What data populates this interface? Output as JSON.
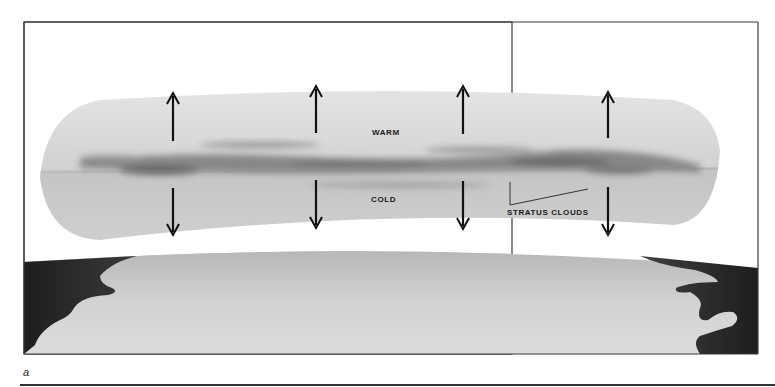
{
  "figure": {
    "panel_label": "a",
    "frame": {
      "x": 24,
      "y": 22,
      "width": 488,
      "height": 332,
      "stroke": "#3a3a3a"
    },
    "labels": {
      "warm": "WARM",
      "cold": "COLD",
      "stratus_clouds": "STRATUS CLOUDS"
    },
    "arrows": {
      "up_x": [
        173,
        316,
        463,
        608
      ],
      "down_x": [
        173,
        316,
        463,
        608
      ]
    },
    "colors": {
      "band_upper": "#d9d9d9",
      "band_lower": "#c9c9c9",
      "cloud_dark": "#5e5e5e",
      "ground_light": "#d8d8d8",
      "ground_dark": "#2c2c2c",
      "ink": "#111111"
    }
  }
}
